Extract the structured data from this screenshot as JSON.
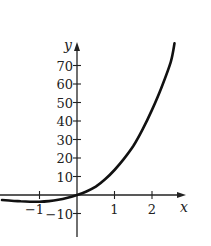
{
  "chart_data": {
    "type": "line",
    "title": "",
    "xlabel": "x",
    "ylabel": "y",
    "xlim": [
      -2,
      2.7
    ],
    "ylim": [
      -15,
      80
    ],
    "grid": false,
    "legend": null,
    "x_ticks": [
      -1,
      1,
      2
    ],
    "x_tick_labels": [
      "−1",
      "1",
      "2"
    ],
    "y_ticks": [
      -10,
      10,
      20,
      30,
      40,
      50,
      60,
      70
    ],
    "y_tick_labels": [
      "−10",
      "10",
      "20",
      "30",
      "40",
      "50",
      "60",
      "70"
    ],
    "series": [
      {
        "name": "f(x)",
        "color": "#111111",
        "x": [
          -2.0,
          -1.75,
          -1.5,
          -1.25,
          -1.0,
          -0.75,
          -0.5,
          -0.25,
          0.0,
          0.25,
          0.5,
          0.75,
          1.0,
          1.25,
          1.5,
          1.75,
          2.0,
          2.25,
          2.5,
          2.6
        ],
        "y": [
          -2.7,
          -3.1,
          -3.4,
          -3.6,
          -3.6,
          -3.3,
          -2.6,
          -1.5,
          0.0,
          1.9,
          4.5,
          8.5,
          13.5,
          19.5,
          26.5,
          35.5,
          46.0,
          58.0,
          72.0,
          82.0
        ]
      }
    ]
  }
}
